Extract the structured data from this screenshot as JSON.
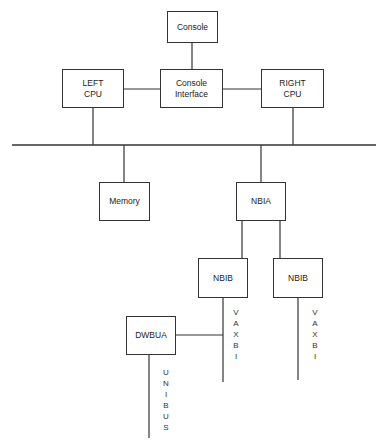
{
  "diagram": {
    "nodes": {
      "console": {
        "label": "Console"
      },
      "console_interface": {
        "line1": "Console",
        "line2": "Interface"
      },
      "left_cpu": {
        "line1": "LEFT",
        "line2": "CPU"
      },
      "right_cpu": {
        "line1": "RIGHT",
        "line2": "CPU"
      },
      "memory": {
        "label": "Memory"
      },
      "nbia": {
        "label": "NBIA"
      },
      "nbib_1": {
        "label": "NBIB"
      },
      "nbib_2": {
        "label": "NBIB"
      },
      "dwbua": {
        "label": "DWBUA"
      }
    },
    "bus_labels": {
      "vaxbi_1": [
        "V",
        "A",
        "X",
        "B",
        "I"
      ],
      "vaxbi_2": [
        "V",
        "A",
        "X",
        "B",
        "I"
      ],
      "unibus": [
        "U",
        "N",
        "I",
        "B",
        "U",
        "S"
      ]
    },
    "edges": [
      [
        "console",
        "console_interface"
      ],
      [
        "left_cpu",
        "console_interface"
      ],
      [
        "console_interface",
        "right_cpu"
      ],
      [
        "left_cpu",
        "system_bus"
      ],
      [
        "right_cpu",
        "system_bus"
      ],
      [
        "system_bus",
        "memory"
      ],
      [
        "system_bus",
        "nbia"
      ],
      [
        "nbia",
        "nbib_1"
      ],
      [
        "nbia",
        "nbib_2"
      ],
      [
        "nbib_1",
        "vaxbi_1"
      ],
      [
        "nbib_2",
        "vaxbi_2"
      ],
      [
        "vaxbi_1",
        "dwbua"
      ],
      [
        "dwbua",
        "unibus"
      ]
    ]
  }
}
